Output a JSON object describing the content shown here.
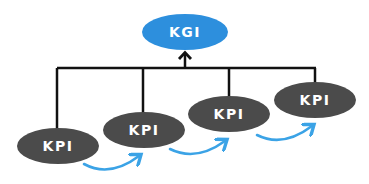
{
  "colors": {
    "kgi_fill": "#2d8fdd",
    "kpi_fill": "#4b4b4b",
    "connector": "#111111",
    "flow_arrow": "#3ba3e6",
    "label": "#ffffff"
  },
  "top_node": {
    "label": "KGI",
    "cx": 185,
    "cy": 32,
    "rx": 43,
    "ry": 18
  },
  "kpi_nodes": [
    {
      "label": "KPI",
      "cx": 58,
      "cy": 146,
      "rx": 41,
      "ry": 18
    },
    {
      "label": "KPI",
      "cx": 144,
      "cy": 130,
      "rx": 41,
      "ry": 18
    },
    {
      "label": "KPI",
      "cx": 229,
      "cy": 114,
      "rx": 41,
      "ry": 18
    },
    {
      "label": "KPI",
      "cx": 315,
      "cy": 100,
      "rx": 41,
      "ry": 18
    }
  ],
  "connector": {
    "bus_y": 68,
    "arrow_tip_y": 52
  },
  "flow_arrows": [
    {
      "from": [
        84,
        164
      ],
      "to": [
        139,
        155
      ]
    },
    {
      "from": [
        170,
        149
      ],
      "to": [
        225,
        140
      ]
    },
    {
      "from": [
        257,
        135
      ],
      "to": [
        312,
        125
      ]
    }
  ]
}
